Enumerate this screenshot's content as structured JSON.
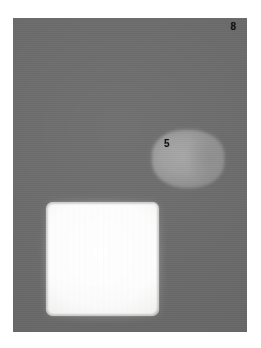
{
  "figure": {
    "panel_label": "8",
    "region_label": "5",
    "background_color": "#6b6b6b",
    "panel_bounds": {
      "x": 13,
      "y": 18,
      "width": 234,
      "height": 314
    },
    "canvas": {
      "width": 261,
      "height": 348,
      "background_color": "#ffffff"
    },
    "objects": [
      {
        "name": "gray-blob",
        "label": "5",
        "shape": "rounded-lozenge",
        "fill_color": "#9a9a9a",
        "edge": "soft",
        "bounds": {
          "x": 152,
          "y": 128,
          "width": 74,
          "height": 60
        }
      },
      {
        "name": "white-square",
        "label": "",
        "shape": "rounded-square",
        "fill_color": "#fdfdfd",
        "edge": "brushy",
        "bounds": {
          "x": 47,
          "y": 203,
          "width": 112,
          "height": 112
        }
      }
    ]
  }
}
